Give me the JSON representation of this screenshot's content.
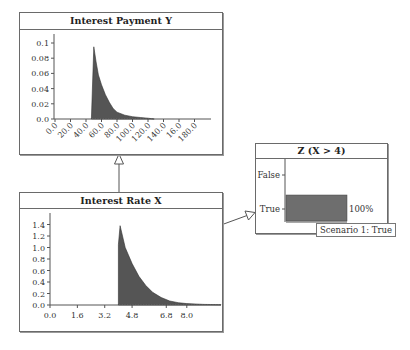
{
  "nodes": {
    "interest_payment": {
      "title": "Interest Payment Y",
      "y_ticks": [
        "0.1",
        "0.08",
        "0.06",
        "0.04",
        "0.02",
        "0.0"
      ],
      "x_ticks": [
        "0.0",
        "20.0",
        "40.0",
        "60.0",
        "80.0",
        "100.0",
        "120.0",
        "140.0",
        "16.0",
        "180.0"
      ]
    },
    "interest_rate": {
      "title": "Interest Rate X",
      "y_ticks": [
        "1.4",
        "1.2",
        "1.0",
        "0.8",
        "0.6",
        "0.4",
        "0.2",
        "0.0"
      ],
      "x_ticks": [
        "0.0",
        "1.6",
        "3.2",
        "4.8",
        "6.8",
        "8.0"
      ]
    },
    "z": {
      "title": "Z (X > 4)",
      "categories": [
        "False",
        "True"
      ],
      "true_value_label": "100%",
      "scenario_label": "Scenario 1: True"
    }
  },
  "colors": {
    "histogram_fill": "#555555",
    "bar_fill": "#6e6e6e",
    "border": "#6a6a6a"
  },
  "chart_data": [
    {
      "type": "bar",
      "title": "Interest Payment Y",
      "xlabel": "",
      "ylabel": "",
      "x_ticks": [
        0,
        20,
        40,
        60,
        80,
        100,
        120,
        140,
        160,
        180
      ],
      "ylim": [
        0,
        0.11
      ],
      "x": [
        47,
        50,
        53,
        56,
        60,
        65,
        70,
        75,
        80,
        90,
        100,
        110,
        120,
        128
      ],
      "values": [
        0.0,
        0.095,
        0.075,
        0.058,
        0.045,
        0.032,
        0.022,
        0.014,
        0.009,
        0.005,
        0.003,
        0.002,
        0.001,
        0.0
      ]
    },
    {
      "type": "bar",
      "title": "Interest Rate X",
      "xlabel": "",
      "ylabel": "",
      "x_ticks": [
        0.0,
        1.6,
        3.2,
        4.8,
        6.8,
        8.0
      ],
      "ylim": [
        0,
        1.5
      ],
      "x": [
        4.0,
        4.1,
        4.4,
        4.8,
        5.2,
        5.6,
        6.0,
        6.5,
        7.0,
        7.5,
        8.0,
        9.0,
        10.0
      ],
      "values": [
        1.05,
        1.38,
        1.0,
        0.72,
        0.5,
        0.34,
        0.22,
        0.13,
        0.07,
        0.04,
        0.025,
        0.01,
        0.005
      ]
    },
    {
      "type": "bar",
      "title": "Z (X > 4)",
      "categories": [
        "False",
        "True"
      ],
      "values": [
        0,
        100
      ],
      "orientation": "horizontal",
      "annotations": [
        "100%",
        "Scenario 1: True"
      ]
    }
  ]
}
